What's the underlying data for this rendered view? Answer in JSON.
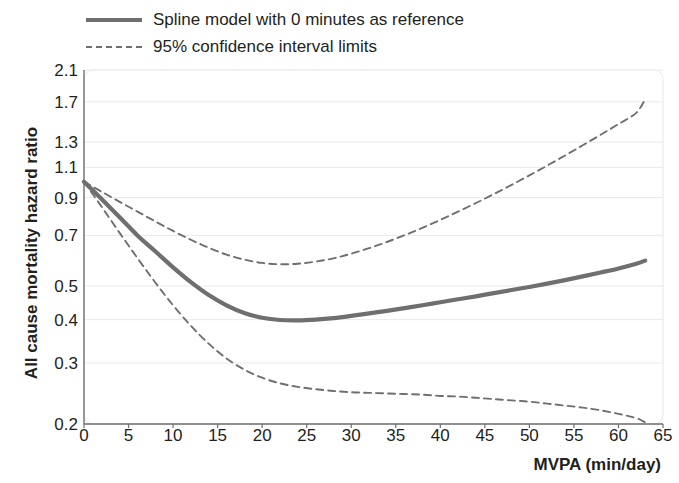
{
  "legend": {
    "items": [
      {
        "label": "Spline model with 0 minutes as reference",
        "style": "solid",
        "sample_name": "legend-sample-spline"
      },
      {
        "label": "95% confidence interval limits",
        "style": "dashed",
        "sample_name": "legend-sample-ci"
      }
    ]
  },
  "axes": {
    "y_title": "All cause mortality hazard ratio",
    "x_title": "MVPA (min/day)"
  },
  "chart_data": {
    "type": "line",
    "title": "",
    "subtitle": "",
    "xlabel": "MVPA (min/day)",
    "ylabel": "All cause mortality hazard ratio",
    "x_scale": "linear",
    "y_scale": "log",
    "xlim": [
      0,
      65
    ],
    "ylim": [
      0.2,
      2.1
    ],
    "grid": true,
    "grid_color": "#e9e9ec",
    "legend_position": "top-left",
    "xticks": [
      0,
      5,
      10,
      15,
      20,
      25,
      30,
      35,
      40,
      45,
      50,
      55,
      60,
      65
    ],
    "xtick_labels": [
      "0",
      "5",
      "10",
      "15",
      "20",
      "25",
      "30",
      "35",
      "40",
      "45",
      "50",
      "55",
      "60",
      "65"
    ],
    "yticks": [
      2.1,
      1.7,
      1.3,
      1.1,
      0.9,
      0.7,
      0.5,
      0.4,
      0.3,
      0.2
    ],
    "ytick_labels": [
      "2.1",
      "1.7",
      "1.3",
      "1.1",
      "0.9",
      "0.7",
      "0.5",
      "0.4",
      "0.3",
      "0.2"
    ],
    "reference_value": 1.0,
    "x": [
      0,
      2,
      4,
      6,
      8,
      10,
      12,
      14,
      16,
      18,
      20,
      22,
      24,
      26,
      28,
      30,
      32,
      34,
      36,
      38,
      40,
      42,
      44,
      46,
      48,
      50,
      52,
      54,
      56,
      58,
      60,
      62,
      63
    ],
    "series": [
      {
        "name": "Spline model with 0 minutes as reference",
        "style": "solid",
        "color": "#6f6f6f",
        "values": [
          1.0,
          0.89,
          0.79,
          0.7,
          0.63,
          0.566,
          0.513,
          0.471,
          0.44,
          0.418,
          0.405,
          0.399,
          0.398,
          0.4,
          0.404,
          0.41,
          0.417,
          0.424,
          0.432,
          0.44,
          0.449,
          0.458,
          0.467,
          0.477,
          0.487,
          0.497,
          0.508,
          0.52,
          0.533,
          0.547,
          0.562,
          0.58,
          0.592
        ]
      },
      {
        "name": "95% confidence interval upper limit",
        "style": "dashed",
        "color": "#6f6f6f",
        "values": [
          1.0,
          0.935,
          0.875,
          0.82,
          0.768,
          0.721,
          0.68,
          0.645,
          0.616,
          0.596,
          0.583,
          0.578,
          0.58,
          0.588,
          0.601,
          0.62,
          0.643,
          0.67,
          0.701,
          0.736,
          0.776,
          0.82,
          0.868,
          0.921,
          0.979,
          1.043,
          1.113,
          1.19,
          1.274,
          1.366,
          1.466,
          1.58,
          1.73
        ]
      },
      {
        "name": "95% confidence interval lower limit",
        "style": "dashed",
        "color": "#6f6f6f",
        "values": [
          1.0,
          0.845,
          0.712,
          0.602,
          0.512,
          0.44,
          0.384,
          0.341,
          0.309,
          0.287,
          0.272,
          0.262,
          0.256,
          0.252,
          0.249,
          0.247,
          0.246,
          0.245,
          0.244,
          0.243,
          0.241,
          0.24,
          0.238,
          0.236,
          0.234,
          0.232,
          0.229,
          0.226,
          0.223,
          0.219,
          0.214,
          0.208,
          0.202
        ]
      }
    ],
    "annotations": []
  }
}
